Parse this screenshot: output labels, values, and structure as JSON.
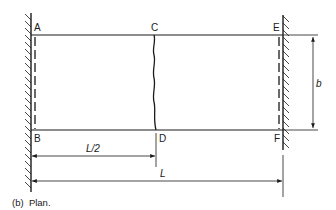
{
  "figure": {
    "caption": "(b)  Plan.",
    "points": {
      "A": "A",
      "B": "B",
      "C": "C",
      "D": "D",
      "E": "E",
      "F": "F"
    },
    "dimensions": {
      "half_span": "L/2",
      "span": "L",
      "width": "b"
    },
    "elements": {
      "left_support": "fixed wall (hatched) at edge AB",
      "right_support": "fixed wall (hatched) at edge EF",
      "crack_line": "wavy line C–D at mid-span",
      "edge_dashes": "dashed lines along AB and EF"
    },
    "colors": {
      "stroke": "#1a1a1a",
      "background": "#ffffff"
    }
  }
}
